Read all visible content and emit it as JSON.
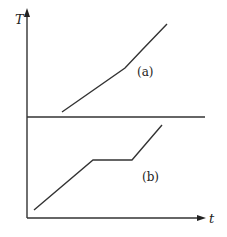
{
  "diagram": {
    "y_axis_label": "T",
    "x_axis_label": "t",
    "curves": [
      {
        "id": "a",
        "label": "(a)",
        "description": "Temperature rises continuously with a slight slope change (no plateau)",
        "points": [
          [
            62,
            112
          ],
          [
            125,
            68
          ],
          [
            142,
            50
          ],
          [
            167,
            24
          ]
        ]
      },
      {
        "id": "b",
        "label": "(b)",
        "description": "Temperature rises, plateaus (constant T), then rises again",
        "points": [
          [
            34,
            210
          ],
          [
            93,
            160
          ],
          [
            132,
            160
          ],
          [
            162,
            125
          ]
        ]
      }
    ],
    "separator": {
      "y": 117,
      "x1": 27,
      "x2": 205
    },
    "colors": {
      "stroke": "#333333",
      "background": "#ffffff"
    }
  }
}
